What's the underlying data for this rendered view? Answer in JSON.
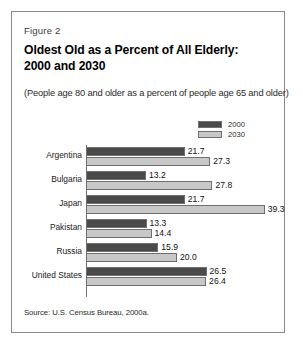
{
  "figure": {
    "label": "Figure 2",
    "title_line1": "Oldest Old as a Percent of All Elderly:",
    "title_line2": "2000 and 2030",
    "subtitle": "(People age 80 and older as a percent of people age 65 and older)",
    "source": "Source:  U.S. Census Bureau, 2000a."
  },
  "colors": {
    "series_2000": "#4a4a4a",
    "series_2030": "#c8c8c8",
    "outline": "#6f6f6f",
    "frame": "#8a8a8a"
  },
  "legend": {
    "items": [
      {
        "label": "2000",
        "color": "#4a4a4a"
      },
      {
        "label": "2030",
        "color": "#c8c8c8"
      }
    ]
  },
  "chart_data": {
    "type": "bar",
    "orientation": "horizontal",
    "title": "Oldest Old as a Percent of All Elderly: 2000 and 2030",
    "subtitle": "(People age 80 and older as a percent of people age 65 and older)",
    "xlabel": "",
    "ylabel": "",
    "xlim": [
      0,
      39.3
    ],
    "grid": false,
    "legend_position": "top-right",
    "categories": [
      "Argentina",
      "Bulgaria",
      "Japan",
      "Pakistan",
      "Russia",
      "United States"
    ],
    "series": [
      {
        "name": "2000",
        "color": "#4a4a4a",
        "values": [
          21.7,
          13.2,
          21.7,
          13.3,
          15.9,
          26.5
        ]
      },
      {
        "name": "2030",
        "color": "#c8c8c8",
        "values": [
          27.3,
          27.8,
          39.3,
          14.4,
          20.0,
          26.4
        ]
      }
    ],
    "value_labels": {
      "2000": [
        "21.7",
        "13.2",
        "21.7",
        "13.3",
        "15.9",
        "26.5"
      ],
      "2030": [
        "27.3",
        "27.8",
        "39.3",
        "14.4",
        "20.0",
        "26.4"
      ]
    },
    "source": "Source:  U.S. Census Bureau, 2000a."
  }
}
